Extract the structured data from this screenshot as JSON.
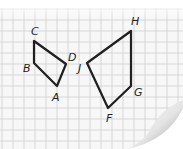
{
  "diagram": {
    "grid": {
      "cell_size": 11,
      "line_color": "#cfcfcf",
      "paper_color": "#f7f7f7"
    },
    "shapes": [
      {
        "name": "ABCD",
        "vertices": [
          {
            "label": "C",
            "x": 34,
            "y": 41,
            "lx": 31,
            "ly": 35
          },
          {
            "label": "B",
            "x": 34,
            "y": 63,
            "lx": 23,
            "ly": 72
          },
          {
            "label": "A",
            "x": 57,
            "y": 86,
            "lx": 52,
            "ly": 101
          },
          {
            "label": "D",
            "x": 66,
            "y": 64,
            "lx": 68,
            "ly": 61
          }
        ]
      },
      {
        "name": "FGHJ",
        "vertices": [
          {
            "label": "H",
            "x": 131,
            "y": 31,
            "lx": 131,
            "ly": 25
          },
          {
            "label": "G",
            "x": 131,
            "y": 86,
            "lx": 134,
            "ly": 96
          },
          {
            "label": "F",
            "x": 108,
            "y": 108,
            "lx": 106,
            "ly": 122
          },
          {
            "label": "J",
            "x": 87,
            "y": 63,
            "lx": 78,
            "ly": 72
          }
        ]
      }
    ],
    "stroke_color": "#1f1f1f"
  }
}
